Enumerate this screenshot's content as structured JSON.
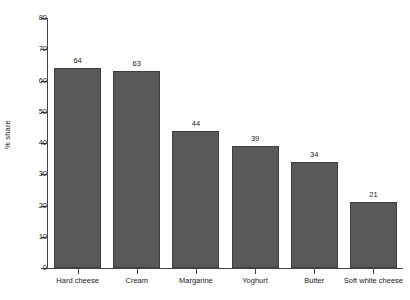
{
  "chart_data": {
    "type": "bar",
    "title": "",
    "subtitle": "",
    "xlabel": "",
    "ylabel": "% share",
    "categories": [
      "Hard cheese",
      "Cream",
      "Margarine",
      "Yoghurt",
      "Butter",
      "Soft white cheese"
    ],
    "values": [
      64,
      63,
      44,
      39,
      34,
      21
    ],
    "value_labels": [
      "64",
      "63",
      "44",
      "39",
      "34",
      "21"
    ],
    "ylim": [
      0,
      80
    ],
    "y_ticks": [
      0,
      10,
      20,
      30,
      40,
      50,
      60,
      70,
      80
    ],
    "y_tick_labels": [
      "0",
      "10",
      "20",
      "30",
      "40",
      "50",
      "60",
      "70",
      "80"
    ],
    "grid": false,
    "legend": false,
    "legend_position": "none",
    "bar_color": "#595959",
    "bar_edge_color": "#3f3f3f",
    "axis_color": "#444444",
    "background_color": "#ffffff",
    "text_color": "#1a1a1a"
  }
}
